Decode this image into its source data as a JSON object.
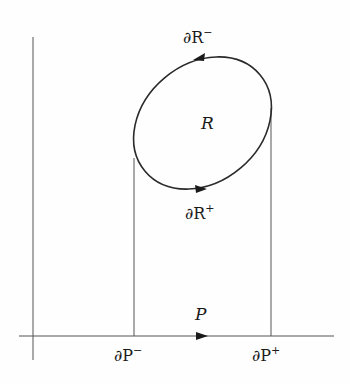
{
  "diagram": {
    "title": "",
    "colors": {
      "line": "#2a2a2a",
      "thin": "#555555",
      "background": "#fefefe"
    },
    "labels": {
      "region": "R",
      "boundary_upper": {
        "base": "∂R",
        "sup": "−"
      },
      "boundary_lower": {
        "base": "∂R",
        "sup": "+"
      },
      "projection": "P",
      "projection_left": {
        "base": "∂P",
        "sup": "−"
      },
      "projection_right": {
        "base": "∂P",
        "sup": "+"
      }
    },
    "elements": {
      "vertical_axis": {
        "x": 33,
        "y1": 37,
        "y2": 360
      },
      "horizontal_axis": {
        "y": 336,
        "x1": 19,
        "x2": 334
      },
      "ellipse": {
        "cx": 202,
        "cy": 123,
        "rx": 70,
        "ry": 55,
        "rotation": -38
      },
      "left_drop_line": {
        "x": 134,
        "y1": 160,
        "y2": 336
      },
      "right_drop_line": {
        "x": 271,
        "y1": 110,
        "y2": 336
      },
      "arrows": [
        {
          "name": "upper-boundary-arrow",
          "x": 200,
          "y": 58,
          "direction": "left"
        },
        {
          "name": "lower-boundary-arrow",
          "x": 200,
          "y": 190,
          "direction": "right"
        },
        {
          "name": "projection-arrow",
          "x": 202,
          "y": 336,
          "direction": "right"
        }
      ]
    }
  }
}
